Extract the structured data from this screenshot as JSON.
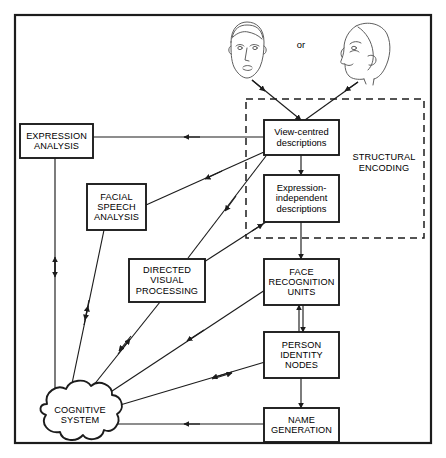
{
  "diagram": {
    "frame": {
      "border_color": "#1c1c1c",
      "background": "#ffffff"
    },
    "stimuli": {
      "face_front_name": "frontal-face-drawing",
      "face_profile_name": "profile-face-drawing",
      "connector_label": "or"
    },
    "grouping": {
      "label": "STRUCTURAL\nENCODING",
      "style": "dashed"
    },
    "nodes": [
      {
        "id": "expression_analysis",
        "label": "EXPRESSION\nANALYSIS",
        "shape": "box",
        "case": "caps"
      },
      {
        "id": "facial_speech_analysis",
        "label": "FACIAL\nSPEECH\nANALYSIS",
        "shape": "box",
        "case": "caps"
      },
      {
        "id": "directed_visual",
        "label": "DIRECTED\nVISUAL\nPROCESSING",
        "shape": "box",
        "case": "caps"
      },
      {
        "id": "view_centred",
        "label": "View-centred\ndescriptions",
        "shape": "box",
        "case": "sentence"
      },
      {
        "id": "expression_independent",
        "label": "Expression-\nindependent\ndescriptions",
        "shape": "box",
        "case": "sentence"
      },
      {
        "id": "face_recognition_units",
        "label": "FACE\nRECOGNITION\nUNITS",
        "shape": "box",
        "case": "caps"
      },
      {
        "id": "person_identity_nodes",
        "label": "PERSON\nIDENTITY\nNODES",
        "shape": "box",
        "case": "caps"
      },
      {
        "id": "name_generation",
        "label": "NAME\nGENERATION",
        "shape": "box",
        "case": "caps"
      },
      {
        "id": "cognitive_system",
        "label": "COGNITIVE\nSYSTEM",
        "shape": "cloud",
        "case": "caps"
      }
    ],
    "edges": [
      {
        "from": "face_front_drawing",
        "to": "view_centred",
        "direction": "one-way"
      },
      {
        "from": "face_profile_drawing",
        "to": "view_centred",
        "direction": "one-way"
      },
      {
        "from": "view_centred",
        "to": "expression_analysis",
        "direction": "one-way"
      },
      {
        "from": "view_centred",
        "to": "facial_speech_analysis",
        "direction": "one-way"
      },
      {
        "from": "view_centred",
        "to": "directed_visual",
        "direction": "one-way"
      },
      {
        "from": "view_centred",
        "to": "expression_independent",
        "direction": "one-way"
      },
      {
        "from": "expression_independent",
        "to": "face_recognition_units",
        "direction": "one-way"
      },
      {
        "from": "directed_visual",
        "to": "expression_independent",
        "direction": "one-way"
      },
      {
        "from": "face_recognition_units",
        "to": "person_identity_nodes",
        "direction": "two-way"
      },
      {
        "from": "person_identity_nodes",
        "to": "name_generation",
        "direction": "one-way"
      },
      {
        "from": "name_generation",
        "to": "cognitive_system",
        "direction": "one-way"
      },
      {
        "from": "expression_analysis",
        "to": "cognitive_system",
        "direction": "two-way"
      },
      {
        "from": "facial_speech_analysis",
        "to": "cognitive_system",
        "direction": "two-way"
      },
      {
        "from": "directed_visual",
        "to": "cognitive_system",
        "direction": "two-way"
      },
      {
        "from": "face_recognition_units",
        "to": "cognitive_system",
        "direction": "two-way"
      },
      {
        "from": "person_identity_nodes",
        "to": "cognitive_system",
        "direction": "two-way"
      }
    ]
  }
}
